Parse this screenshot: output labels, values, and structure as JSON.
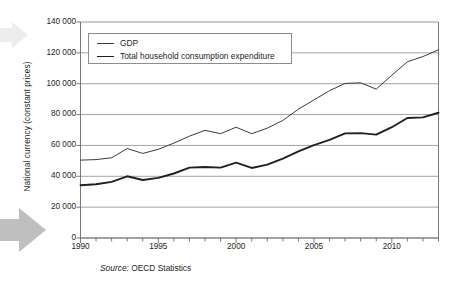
{
  "figure": {
    "source_prefix": "Source:",
    "source_text": " OECD Statistics",
    "arrow_top_name": "decorative-arrow",
    "arrow_bottom_name": "decorative-arrow"
  },
  "chart_data": {
    "type": "line",
    "title": "",
    "xlabel": "",
    "ylabel": "National currency (constant prices)",
    "xlim": [
      1990,
      2013
    ],
    "ylim": [
      0,
      140000
    ],
    "grid": true,
    "legend_position": "top-left",
    "ytick_labels": [
      "0",
      "20 000",
      "40 000",
      "60 000",
      "80 000",
      "100 000",
      "120 000",
      "140 000"
    ],
    "ytick_values": [
      0,
      20000,
      40000,
      60000,
      80000,
      100000,
      120000,
      140000
    ],
    "xtick_labels": [
      "1990",
      "1995",
      "2000",
      "2005",
      "2010"
    ],
    "xtick_values": [
      1990,
      1995,
      2000,
      2005,
      2010
    ],
    "x": [
      1990,
      1991,
      1992,
      1993,
      1994,
      1995,
      1996,
      1997,
      1998,
      1999,
      2000,
      2001,
      2002,
      2003,
      2004,
      2005,
      2006,
      2007,
      2008,
      2009,
      2010,
      2011,
      2012,
      2013
    ],
    "series": [
      {
        "name": "GDP",
        "color": "#3b3b3b",
        "width": 1.0,
        "values": [
          50500,
          50800,
          52000,
          58000,
          54800,
          57500,
          61500,
          66000,
          69800,
          67600,
          71800,
          67600,
          71200,
          76200,
          83500,
          89500,
          95500,
          100200,
          100600,
          96500,
          105500,
          114200,
          117600,
          122000
        ]
      },
      {
        "name": "Total household consumption expenditure",
        "color": "#231f20",
        "width": 1.9,
        "values": [
          34200,
          34800,
          36400,
          40000,
          37600,
          39000,
          41800,
          45600,
          46000,
          45600,
          48800,
          45400,
          47600,
          51500,
          56200,
          60200,
          63600,
          67800,
          68000,
          67000,
          71800,
          77800,
          78200,
          81200
        ]
      }
    ]
  }
}
